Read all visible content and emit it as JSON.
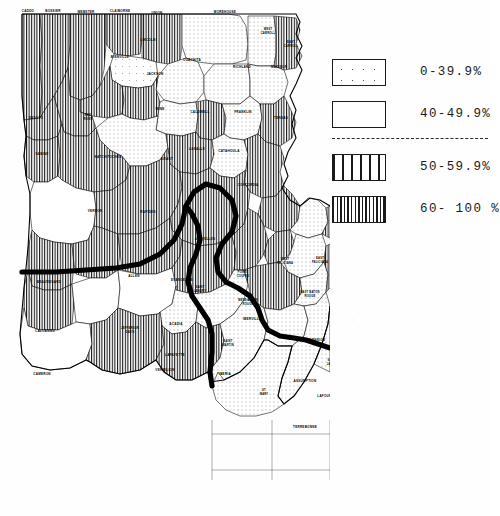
{
  "document": {
    "type": "choropleth-map",
    "region": "Louisiana",
    "subject": "Parish-level percentage distribution"
  },
  "legend": {
    "divider": "dashed-separator",
    "classes": [
      {
        "label": "0-39.9%",
        "pattern": "sparse-dots",
        "range_low": 0,
        "range_high": 39.9
      },
      {
        "label": "40-49.9%",
        "pattern": "dense-dots",
        "range_low": 40,
        "range_high": 49.9
      },
      {
        "label": "50-59.9%",
        "pattern": "wide-stripes",
        "range_low": 50,
        "range_high": 59.9
      },
      {
        "label": "60- 100 %",
        "pattern": "dense-stripes",
        "range_low": 60,
        "range_high": 100
      }
    ]
  },
  "map": {
    "boundary_overlay": "thick-black-region-boundary",
    "parishes": [
      {
        "name": "CADDO",
        "class": 3,
        "x": 28,
        "y": 12
      },
      {
        "name": "BOSSIER",
        "class": 3,
        "x": 53,
        "y": 12
      },
      {
        "name": "WEBSTER",
        "class": 3,
        "x": 86,
        "y": 13
      },
      {
        "name": "CLAIBORNE",
        "class": 3,
        "x": 120,
        "y": 12
      },
      {
        "name": "UNION",
        "class": 3,
        "x": 157,
        "y": 14
      },
      {
        "name": "MOREHOUSE",
        "class": 1,
        "x": 225,
        "y": 13
      },
      {
        "name": "WEST CARROLL",
        "class": 1,
        "x": 268,
        "y": 32
      },
      {
        "name": "EAST CARROLL",
        "class": 3,
        "x": 291,
        "y": 45
      },
      {
        "name": "LINCOLN",
        "class": 0,
        "x": 148,
        "y": 41
      },
      {
        "name": "BIENVILLE",
        "class": 3,
        "x": 120,
        "y": 58
      },
      {
        "name": "JACKSON",
        "class": 3,
        "x": 155,
        "y": 75
      },
      {
        "name": "OUACHITA",
        "class": 1,
        "x": 192,
        "y": 61
      },
      {
        "name": "RICHLAND",
        "class": 1,
        "x": 242,
        "y": 68
      },
      {
        "name": "MADISON",
        "class": 1,
        "x": 279,
        "y": 68
      },
      {
        "name": "DESOTO",
        "class": 3,
        "x": 36,
        "y": 119
      },
      {
        "name": "RED RIVER",
        "class": 3,
        "x": 88,
        "y": 118
      },
      {
        "name": "WINN",
        "class": 1,
        "x": 160,
        "y": 110
      },
      {
        "name": "CALDWELL",
        "class": 3,
        "x": 200,
        "y": 113
      },
      {
        "name": "FRANKLIN",
        "class": 1,
        "x": 243,
        "y": 113
      },
      {
        "name": "TENSAS",
        "class": 3,
        "x": 281,
        "y": 119
      },
      {
        "name": "SABINE",
        "class": 3,
        "x": 42,
        "y": 155
      },
      {
        "name": "NATCHITOCHES",
        "class": 3,
        "x": 108,
        "y": 158
      },
      {
        "name": "GRANT",
        "class": 1,
        "x": 167,
        "y": 160
      },
      {
        "name": "LASALLE",
        "class": 3,
        "x": 197,
        "y": 150
      },
      {
        "name": "CATAHOULA",
        "class": 1,
        "x": 229,
        "y": 152
      },
      {
        "name": "CONCORDIA",
        "class": 3,
        "x": 248,
        "y": 186
      },
      {
        "name": "VERNON",
        "class": 0,
        "x": 95,
        "y": 212
      },
      {
        "name": "RAPIDES",
        "class": 3,
        "x": 148,
        "y": 213
      },
      {
        "name": "AVOYELLES",
        "class": 3,
        "x": 205,
        "y": 240
      },
      {
        "name": "BEAUREGARD",
        "class": 3,
        "x": 49,
        "y": 283
      },
      {
        "name": "ALLEN",
        "class": 3,
        "x": 134,
        "y": 277
      },
      {
        "name": "EVANGELINE",
        "class": 3,
        "x": 182,
        "y": 281
      },
      {
        "name": "POINTE COUPEE",
        "class": 3,
        "x": 243,
        "y": 275
      },
      {
        "name": "WEST FELICIANA",
        "class": 3,
        "x": 285,
        "y": 262
      },
      {
        "name": "EAST FELICIANA",
        "class": 1,
        "x": 320,
        "y": 261
      },
      {
        "name": "SAINT HELENA",
        "class": 3,
        "x": 350,
        "y": 262
      },
      {
        "name": "WASHINGTON",
        "class": 3,
        "x": 397,
        "y": 265
      },
      {
        "name": "SAINT LANDRY",
        "class": 3,
        "x": 200,
        "y": 290
      },
      {
        "name": "WEST BATON ROUGE",
        "class": 3,
        "x": 248,
        "y": 303
      },
      {
        "name": "EAST BATON ROUGE",
        "class": 1,
        "x": 310,
        "y": 295
      },
      {
        "name": "LIVINGSTON",
        "class": 3,
        "x": 347,
        "y": 302
      },
      {
        "name": "TANGIPAHOA",
        "class": 1,
        "x": 366,
        "y": 290
      },
      {
        "name": "SAINT TAMMANY",
        "class": 0,
        "x": 406,
        "y": 309
      },
      {
        "name": "CALCASIEU",
        "class": 3,
        "x": 45,
        "y": 332
      },
      {
        "name": "JEFFERSON DAVIS",
        "class": 0,
        "x": 130,
        "y": 331
      },
      {
        "name": "ACADIA",
        "class": 0,
        "x": 176,
        "y": 325
      },
      {
        "name": "IBERVILLE",
        "class": 3,
        "x": 252,
        "y": 320
      },
      {
        "name": "ASCENSION",
        "class": 1,
        "x": 315,
        "y": 341
      },
      {
        "name": "LAFAYETTE",
        "class": 1,
        "x": 175,
        "y": 356
      },
      {
        "name": "SAINT MARTIN",
        "class": 1,
        "x": 228,
        "y": 344
      },
      {
        "name": "SAINT JAMES",
        "class": 1,
        "x": 332,
        "y": 363
      },
      {
        "name": "SAINT JOHN THE BAPTIST",
        "class": 1,
        "x": 361,
        "y": 358
      },
      {
        "name": "SAINT CHARLES",
        "class": 1,
        "x": 365,
        "y": 384
      },
      {
        "name": "ORLEANS",
        "class": 0,
        "x": 404,
        "y": 373
      },
      {
        "name": "JEFFERSON",
        "class": 3,
        "x": 398,
        "y": 390
      },
      {
        "name": "SAINT BERNARD",
        "class": 3,
        "x": 428,
        "y": 388
      },
      {
        "name": "CAMERON",
        "class": 0,
        "x": 42,
        "y": 375
      },
      {
        "name": "VERMILION",
        "class": 3,
        "x": 165,
        "y": 371
      },
      {
        "name": "IBERIA",
        "class": 3,
        "x": 225,
        "y": 375
      },
      {
        "name": "ST MARY",
        "class": 1,
        "x": 264,
        "y": 393
      },
      {
        "name": "ASSUMPTION",
        "class": 1,
        "x": 305,
        "y": 382
      },
      {
        "name": "LAFOURCHE",
        "class": 1,
        "x": 328,
        "y": 397
      },
      {
        "name": "TERREBONNE",
        "class": 1,
        "x": 305,
        "y": 428
      },
      {
        "name": "PLAQUEMINES",
        "class": 3,
        "x": 415,
        "y": 414
      }
    ]
  }
}
